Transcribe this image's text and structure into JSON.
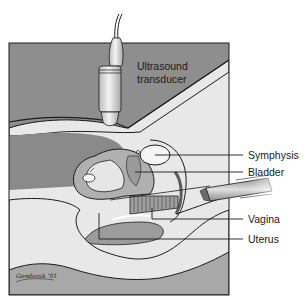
{
  "figure": {
    "colors": {
      "background": "#ffffff",
      "dark_tissue": "#8a8a8a",
      "mid_tissue": "#a9a9a9",
      "light_tissue": "#e6e6e6",
      "outline": "#1c1c1c"
    },
    "labels": {
      "transducer_line1": "Ultrasound",
      "transducer_line2": "transducer",
      "symphysis": "Symphysis",
      "bladder": "Bladder",
      "vagina": "Vagina",
      "uterus": "Uterus"
    },
    "signature": "Gondorak '91"
  }
}
